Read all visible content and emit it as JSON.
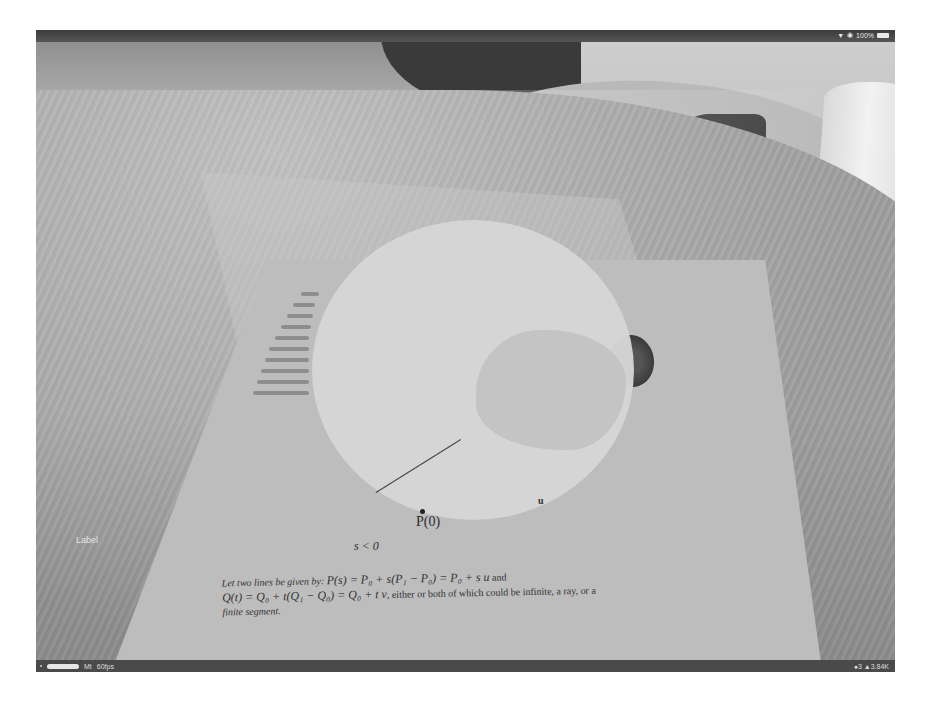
{
  "status_bar": {
    "wifi_icon": "wifi-icon",
    "orientation_lock_icon": "orientation-lock-icon",
    "battery_percent": "100%",
    "battery_icon": "battery-icon"
  },
  "scene": {
    "ar_label": "Label",
    "paper": {
      "point_label": "P(0)",
      "ray_label": "s < 0",
      "vector_mark": "u",
      "paragraph": {
        "intro": "Let two lines be given by:",
        "eq1": "P(s) = P₀ + s(P₁ − P₀) = P₀ + s u",
        "and": "and",
        "eq2": "Q(t) = Q₀ + t(Q₁ − Q₀) = Q₀ + t v",
        "rest": ", either or both of which could be infinite, a ray, or a",
        "end": "finite segment."
      }
    }
  },
  "debug_bar": {
    "left_dot_icon": "indicator-dot-icon",
    "progress_pill": "progress-pill",
    "renderer": "Mt",
    "fps": "60fps",
    "right_stats": "●3 ▲3.84K"
  }
}
